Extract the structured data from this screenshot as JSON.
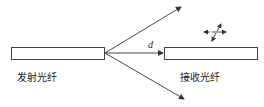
{
  "diagram": {
    "title": "",
    "emitter": {
      "label": "发射光纤"
    },
    "receiver": {
      "label": "接收光纤"
    },
    "gap_label": "d",
    "colors": {
      "stroke": "#333333",
      "background": "#ffffff",
      "text": "#222222"
    }
  }
}
